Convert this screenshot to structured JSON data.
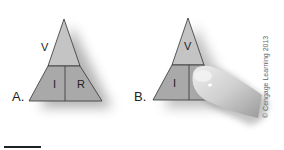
{
  "figure": {
    "panels": [
      {
        "label": "A.",
        "triangle": {
          "top": "V",
          "bottom_left": "I",
          "bottom_right": "R"
        },
        "finger_covering": null
      },
      {
        "label": "B.",
        "triangle": {
          "top": "V",
          "bottom_left": "I",
          "bottom_right": ""
        },
        "finger_covering": "R"
      }
    ],
    "credit": "© Cengage Learning 2013",
    "colors": {
      "triangle_top": "#c4c4c4",
      "triangle_bottom": "#a9a9a9",
      "outline": "#333333",
      "shadow": "#777777",
      "finger": "#cfcfcf"
    }
  }
}
